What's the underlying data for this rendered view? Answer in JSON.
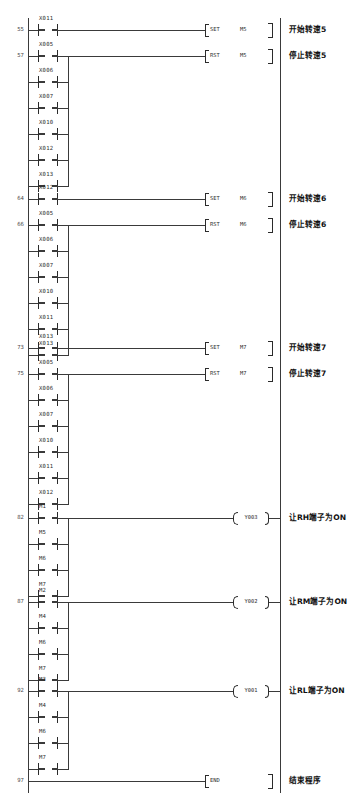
{
  "diagram": {
    "type": "ladder-diagram",
    "rungs": [
      {
        "number": "55",
        "contacts": [
          {
            "device": "X011",
            "type": "NO"
          }
        ],
        "branch": [],
        "instruction": {
          "op": "SET",
          "operand": "M5"
        },
        "comment": "开始转速5"
      },
      {
        "number": "57",
        "contacts": [
          {
            "device": "X005",
            "type": "NO"
          }
        ],
        "branch": [
          {
            "device": "X006",
            "type": "NO"
          },
          {
            "device": "X007",
            "type": "NO"
          },
          {
            "device": "X010",
            "type": "NO"
          },
          {
            "device": "X012",
            "type": "NO"
          },
          {
            "device": "X013",
            "type": "NO"
          }
        ],
        "instruction": {
          "op": "RST",
          "operand": "M5"
        },
        "comment": "停止转速5"
      },
      {
        "number": "64",
        "contacts": [
          {
            "device": "X012",
            "type": "NO"
          }
        ],
        "branch": [],
        "instruction": {
          "op": "SET",
          "operand": "M6"
        },
        "comment": "开始转速6"
      },
      {
        "number": "66",
        "contacts": [
          {
            "device": "X005",
            "type": "NO"
          }
        ],
        "branch": [
          {
            "device": "X006",
            "type": "NO"
          },
          {
            "device": "X007",
            "type": "NO"
          },
          {
            "device": "X010",
            "type": "NO"
          },
          {
            "device": "X011",
            "type": "NO"
          },
          {
            "device": "X013",
            "type": "NO"
          }
        ],
        "instruction": {
          "op": "RST",
          "operand": "M6"
        },
        "comment": "停止转速6"
      },
      {
        "number": "73",
        "contacts": [
          {
            "device": "X013",
            "type": "NO"
          }
        ],
        "branch": [],
        "instruction": {
          "op": "SET",
          "operand": "M7"
        },
        "comment": "开始转速7"
      },
      {
        "number": "75",
        "contacts": [
          {
            "device": "X005",
            "type": "NO"
          }
        ],
        "branch": [
          {
            "device": "X006",
            "type": "NO"
          },
          {
            "device": "X007",
            "type": "NO"
          },
          {
            "device": "X010",
            "type": "NO"
          },
          {
            "device": "X011",
            "type": "NO"
          },
          {
            "device": "X012",
            "type": "NO"
          }
        ],
        "instruction": {
          "op": "RST",
          "operand": "M7"
        },
        "comment": "停止转速7"
      },
      {
        "number": "82",
        "contacts": [
          {
            "device": "M1",
            "type": "NO"
          }
        ],
        "branch": [
          {
            "device": "M5",
            "type": "NO"
          },
          {
            "device": "M6",
            "type": "NO"
          },
          {
            "device": "M7",
            "type": "NO"
          }
        ],
        "coil": {
          "device": "Y003"
        },
        "comment": "让RH端子为ON"
      },
      {
        "number": "87",
        "contacts": [
          {
            "device": "M2",
            "type": "NO"
          }
        ],
        "branch": [
          {
            "device": "M4",
            "type": "NO"
          },
          {
            "device": "M6",
            "type": "NO"
          },
          {
            "device": "M7",
            "type": "NO"
          }
        ],
        "coil": {
          "device": "Y002"
        },
        "comment": "让RM端子为ON"
      },
      {
        "number": "92",
        "contacts": [
          {
            "device": "M3",
            "type": "NO"
          }
        ],
        "branch": [
          {
            "device": "M4",
            "type": "NO"
          },
          {
            "device": "M6",
            "type": "NO"
          },
          {
            "device": "M7",
            "type": "NO"
          }
        ],
        "coil": {
          "device": "Y001"
        },
        "comment": "让RL端子为ON"
      },
      {
        "number": "97",
        "contacts": [],
        "branch": [],
        "instruction": {
          "op": "END",
          "operand": ""
        },
        "comment": "结束程序"
      }
    ],
    "colors": {
      "line": "#3a3a3a",
      "text": "#2b2b2b",
      "background": "#ffffff"
    }
  }
}
